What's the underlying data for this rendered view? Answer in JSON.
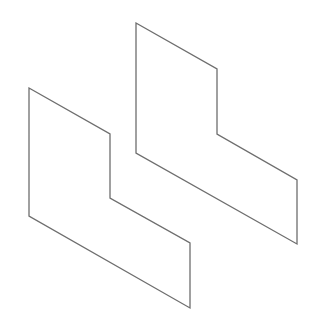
{
  "canvas": {
    "width": 310,
    "height": 325,
    "background": "#ffffff"
  },
  "stroke_color": "#6e6e6e",
  "shapes": [
    {
      "name": "left-l-shape",
      "points": [
        [
          29,
          88
        ],
        [
          110,
          134
        ],
        [
          110,
          198
        ],
        [
          190,
          243
        ],
        [
          190,
          308
        ],
        [
          29,
          216
        ]
      ]
    },
    {
      "name": "right-l-shape",
      "points": [
        [
          136,
          23
        ],
        [
          217,
          69
        ],
        [
          217,
          134
        ],
        [
          297,
          180
        ],
        [
          297,
          244
        ],
        [
          136,
          153
        ]
      ]
    }
  ]
}
